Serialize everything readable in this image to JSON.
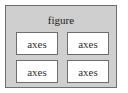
{
  "figure": {
    "label": "figure",
    "axes": [
      {
        "label": "axes",
        "row": 0,
        "col": 0
      },
      {
        "label": "axes",
        "row": 0,
        "col": 1
      },
      {
        "label": "axes",
        "row": 1,
        "col": 0
      },
      {
        "label": "axes",
        "row": 1,
        "col": 1
      }
    ]
  }
}
